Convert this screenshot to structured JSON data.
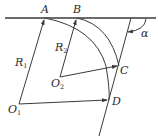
{
  "figure": {
    "type": "geometry-diagram",
    "points": {
      "A": {
        "label": "A"
      },
      "B": {
        "label": "B"
      },
      "C": {
        "label": "C"
      },
      "D": {
        "label": "D"
      },
      "O1": {
        "label": "O",
        "sub": "1"
      },
      "O2": {
        "label": "O",
        "sub": "2"
      }
    },
    "radii": {
      "R1": {
        "label": "R",
        "sub": "1"
      },
      "R2": {
        "label": "R",
        "sub": "2"
      }
    },
    "angle": {
      "label": "α"
    }
  },
  "colors": {
    "stroke": "#3a3a3a",
    "text": "#2a2a2a",
    "background": "#ffffff"
  }
}
